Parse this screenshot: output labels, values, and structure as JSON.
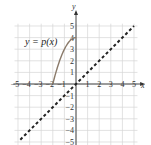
{
  "chart_data": {
    "type": "line",
    "title": "",
    "xlabel": "x",
    "ylabel": "y",
    "xlim": [
      -5,
      5
    ],
    "ylim": [
      -5,
      5
    ],
    "grid": true,
    "x_ticks": [
      "-5",
      "-4",
      "-3",
      "-2",
      "-1",
      "1",
      "2",
      "3",
      "4",
      "5"
    ],
    "y_ticks": [
      "5",
      "4",
      "3",
      "2",
      "1",
      "-1",
      "-2",
      "-3",
      "-4",
      "-5"
    ],
    "series": [
      {
        "name": "y = p(x)",
        "style": "solid",
        "color": "#8a7a6a",
        "x": [
          -2,
          -1.5,
          -1,
          -0.5,
          0
        ],
        "y": [
          0,
          1.75,
          3,
          3.75,
          4
        ]
      },
      {
        "name": "y = x",
        "style": "dashed",
        "color": "#222222",
        "x": [
          -4.8,
          5
        ],
        "y": [
          -4.8,
          5
        ]
      }
    ],
    "annotations": [
      {
        "text": "y = p(x)",
        "x": -4.4,
        "y": 3.5
      }
    ]
  },
  "labels": {
    "x_axis": "x",
    "y_axis": "y",
    "function_label": "y = p(x)"
  }
}
